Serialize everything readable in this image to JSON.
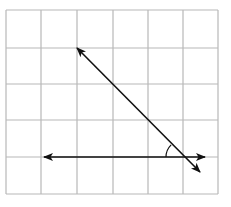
{
  "diagram": {
    "type": "geometry-grid",
    "grid": {
      "columns": 6,
      "rows": 5,
      "x_lines": [
        6,
        41,
        77,
        113,
        148,
        183,
        218
      ],
      "y_lines": [
        10,
        48,
        84,
        120,
        157,
        194
      ],
      "line_color": "#b8b8b8"
    },
    "lines": [
      {
        "name": "horizontal-line",
        "from": [
          44,
          157
        ],
        "to": [
          205,
          157
        ],
        "arrows": [
          "start",
          "end"
        ],
        "color": "#111111"
      },
      {
        "name": "diagonal-line",
        "from": [
          77,
          48
        ],
        "to": [
          200,
          172
        ],
        "arrows": [
          "start",
          "end"
        ],
        "color": "#111111"
      }
    ],
    "intersection": [
      183,
      157
    ],
    "angle_mark": {
      "vertex": [
        183,
        157
      ],
      "radius": 17,
      "between": [
        "horizontal-line-left",
        "diagonal-line-upper"
      ],
      "color": "#111111"
    }
  }
}
